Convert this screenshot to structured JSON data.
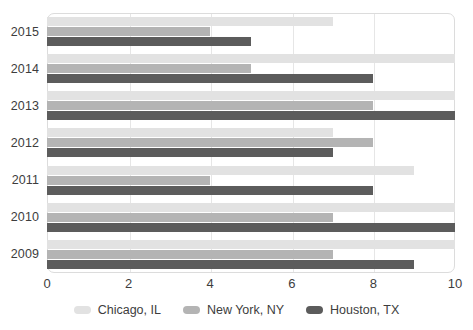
{
  "chart_data": {
    "type": "bar",
    "orientation": "horizontal",
    "title": "",
    "xlabel": "",
    "ylabel": "",
    "categories": [
      "2015",
      "2014",
      "2013",
      "2012",
      "2011",
      "2010",
      "2009"
    ],
    "series": [
      {
        "name": "Chicago, IL",
        "color": "#e2e2e2",
        "values": [
          7,
          10,
          10,
          7,
          9,
          10,
          10
        ]
      },
      {
        "name": "New York, NY",
        "color": "#b4b4b4",
        "values": [
          4,
          5,
          8,
          8,
          4,
          7,
          7
        ]
      },
      {
        "name": "Houston, TX",
        "color": "#5c5c5c",
        "values": [
          5,
          8,
          10,
          7,
          8,
          10,
          9
        ]
      }
    ],
    "xlim": [
      0,
      10
    ],
    "xticks": [
      "0",
      "2",
      "4",
      "6",
      "8",
      "10"
    ],
    "xtick_values": [
      0,
      2,
      4,
      6,
      8,
      10
    ],
    "grid": true,
    "legend_position": "bottom"
  }
}
